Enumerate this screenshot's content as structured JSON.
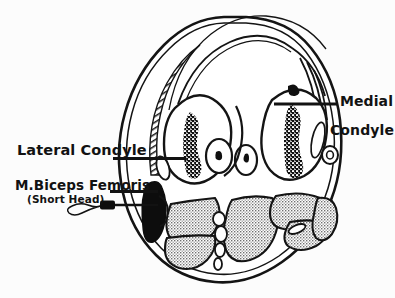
{
  "figure": {
    "view": "axial cross-section of distal femur",
    "background_color": "#fcfcfc",
    "ink_color": "#121212",
    "muscle_fill_color": "#9a9a9a",
    "bone_marrow_color": "#101010"
  },
  "labels": {
    "lateral_condyle": "Lateral Condyle",
    "biceps_femoris": "M.Biceps Femoris",
    "short_head": "(Short Head)",
    "medial_condyle_line1": "Medial",
    "medial_condyle_line2": "Condyle"
  },
  "structures": [
    {
      "name": "lateral-condyle",
      "kind": "bone",
      "side": "left"
    },
    {
      "name": "medial-condyle",
      "kind": "bone",
      "side": "right"
    },
    {
      "name": "intercondylar-vessels",
      "kind": "vessel",
      "count": 2
    },
    {
      "name": "popliteal-vessel",
      "kind": "vessel",
      "side": "right"
    },
    {
      "name": "biceps-femoris-short-head",
      "kind": "muscle",
      "shading": "solid-black"
    },
    {
      "name": "posterior-muscle-group",
      "kind": "muscle",
      "shading": "stipple"
    },
    {
      "name": "skin-outline",
      "kind": "outline"
    },
    {
      "name": "fascia-band",
      "kind": "outline"
    }
  ],
  "annotations": [
    {
      "name": "lateral-condyle-leader",
      "type": "leader-bar"
    },
    {
      "name": "medial-condyle-leader",
      "type": "leader-bar"
    },
    {
      "name": "biceps-leader",
      "type": "leader-bar"
    },
    {
      "name": "emg-needle",
      "type": "needle-electrode"
    }
  ]
}
